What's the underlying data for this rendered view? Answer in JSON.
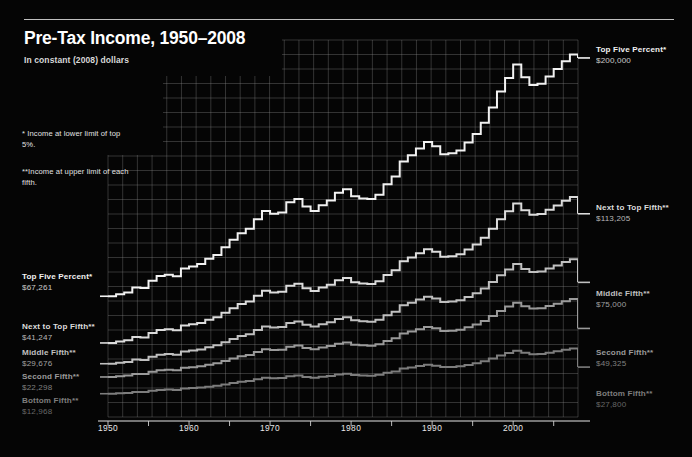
{
  "header": {
    "title": "Pre-Tax Income, 1950–2008",
    "subtitle": "In constant (2008) dollars"
  },
  "footnotes": [
    "* Income at lower limit of top 5%.",
    "**Income at upper limit of each fifth."
  ],
  "labels_left": [
    {
      "name": "Top Five Percent*",
      "value": "$67,261",
      "color": "#f2f2f2",
      "x": 22,
      "y": 272
    },
    {
      "name": "Next to Top Fifth**",
      "value": "$41,247",
      "color": "#dcdcdc",
      "x": 22,
      "y": 322
    },
    {
      "name": "Middle Fifth**",
      "value": "$29,676",
      "color": "#c0c0c0",
      "x": 22,
      "y": 348
    },
    {
      "name": "Second Fifth**",
      "value": "$22,298",
      "color": "#9a9a9a",
      "x": 22,
      "y": 372
    },
    {
      "name": "Bottom Fifth**",
      "value": "$12,968",
      "color": "#7d7d7d",
      "x": 22,
      "y": 396
    }
  ],
  "labels_right": [
    {
      "name": "Top Five Percent*",
      "value": "$200,000",
      "color": "#f2f2f2",
      "x": 596,
      "y": 45
    },
    {
      "name": "Next to Top Fifth**",
      "value": "$113,205",
      "color": "#dcdcdc",
      "x": 596,
      "y": 203
    },
    {
      "name": "Middle Fifth**",
      "value": "$75,000",
      "color": "#c0c0c0",
      "x": 596,
      "y": 289
    },
    {
      "name": "Second Fifth**",
      "value": "$49,325",
      "color": "#9a9a9a",
      "x": 596,
      "y": 348
    },
    {
      "name": "Bottom Fifth**",
      "value": "$27,800",
      "color": "#7d7d7d",
      "x": 596,
      "y": 389
    }
  ],
  "axis": {
    "x_ticks_major": [
      1950,
      1960,
      1970,
      1980,
      1990,
      2000
    ],
    "x_ticks_minor": [
      1955,
      1965,
      1975,
      1985,
      1995,
      2005
    ],
    "x_min": 1950,
    "x_max": 2008
  },
  "chart_data": {
    "type": "line",
    "title": "Pre-Tax Income, 1950–2008",
    "subtitle": "In constant (2008) dollars",
    "xlabel": "",
    "ylabel": "",
    "xlim": [
      1950,
      2008
    ],
    "ylim": [
      0,
      210000
    ],
    "grid": true,
    "legend": "inline-endpoint-labels",
    "notes": [
      "* Income at lower limit of top 5%.",
      "**Income at upper limit of each fifth."
    ],
    "x": [
      1950,
      1951,
      1952,
      1953,
      1954,
      1955,
      1956,
      1957,
      1958,
      1959,
      1960,
      1961,
      1962,
      1963,
      1964,
      1965,
      1966,
      1967,
      1968,
      1969,
      1970,
      1971,
      1972,
      1973,
      1974,
      1975,
      1976,
      1977,
      1978,
      1979,
      1980,
      1981,
      1982,
      1983,
      1984,
      1985,
      1986,
      1987,
      1988,
      1989,
      1990,
      1991,
      1992,
      1993,
      1994,
      1995,
      1996,
      1997,
      1998,
      1999,
      2000,
      2001,
      2002,
      2003,
      2004,
      2005,
      2006,
      2007,
      2008
    ],
    "series": [
      {
        "name": "Top Five Percent*",
        "note": "Income at lower limit of top 5%.",
        "color": "#f2f2f2",
        "start_value": 67261,
        "end_value": 200000,
        "values": [
          67261,
          68400,
          69300,
          72100,
          71800,
          75900,
          78600,
          79200,
          78400,
          82700,
          83900,
          85200,
          88100,
          90300,
          94600,
          98700,
          102400,
          104900,
          110200,
          114800,
          113200,
          113900,
          119600,
          121400,
          117300,
          114800,
          117900,
          120600,
          124900,
          126800,
          122900,
          121700,
          121400,
          123800,
          129600,
          133900,
          142300,
          145800,
          149600,
          153200,
          150800,
          146300,
          146900,
          148400,
          152900,
          157600,
          163900,
          172400,
          181300,
          188900,
          196400,
          189200,
          184900,
          185600,
          189700,
          193800,
          198100,
          201900,
          200000
        ]
      },
      {
        "name": "Next to Top Fifth**",
        "note": "Income at upper limit of each fifth.",
        "color": "#dcdcdc",
        "start_value": 41247,
        "end_value": 113205,
        "values": [
          41247,
          42100,
          42800,
          44600,
          44300,
          46800,
          48400,
          48900,
          48300,
          50900,
          51600,
          52400,
          54200,
          55600,
          58100,
          60600,
          62900,
          64300,
          67500,
          70300,
          69400,
          69800,
          73100,
          74200,
          71700,
          70200,
          72100,
          73700,
          76200,
          77400,
          75100,
          74300,
          74100,
          75600,
          79100,
          81700,
          86800,
          88900,
          91200,
          93400,
          92000,
          89300,
          89600,
          90600,
          93300,
          96100,
          99900,
          104900,
          110100,
          114600,
          118900,
          115100,
          112700,
          113100,
          115400,
          117800,
          120400,
          122600,
          113205
        ]
      },
      {
        "name": "Middle Fifth**",
        "note": "Income at upper limit of each fifth.",
        "color": "#c0c0c0",
        "start_value": 29676,
        "end_value": 75000,
        "values": [
          29676,
          30200,
          30700,
          32000,
          31800,
          33600,
          34700,
          35100,
          34700,
          36500,
          37000,
          37600,
          38900,
          39900,
          41700,
          43500,
          45100,
          46100,
          48400,
          50400,
          49800,
          50100,
          52400,
          53200,
          51400,
          50400,
          51700,
          52800,
          54600,
          55500,
          53900,
          53300,
          53100,
          54200,
          56700,
          58600,
          62200,
          63700,
          65400,
          67000,
          66000,
          64000,
          64300,
          65000,
          66900,
          68900,
          71600,
          75200,
          78900,
          82200,
          85200,
          82500,
          80800,
          81100,
          82700,
          84400,
          86300,
          87900,
          75000
        ]
      },
      {
        "name": "Second Fifth**",
        "note": "Income at upper limit of each fifth.",
        "color": "#9a9a9a",
        "start_value": 22298,
        "end_value": 49325,
        "values": [
          22298,
          22700,
          23100,
          24000,
          23900,
          25200,
          26000,
          26300,
          26000,
          27400,
          27700,
          28200,
          29100,
          29900,
          31200,
          32600,
          33800,
          34500,
          36200,
          37700,
          37300,
          37500,
          39200,
          39800,
          38500,
          37700,
          38700,
          39500,
          40800,
          41500,
          40300,
          39900,
          39700,
          40500,
          42400,
          43800,
          46500,
          47600,
          48900,
          50100,
          49400,
          47900,
          48100,
          48600,
          50000,
          51500,
          53500,
          56200,
          59000,
          61500,
          63700,
          61700,
          60400,
          60600,
          61800,
          63100,
          64500,
          65700,
          49325
        ]
      },
      {
        "name": "Bottom Fifth**",
        "note": "Income at upper limit of each fifth.",
        "color": "#7d7d7d",
        "start_value": 12968,
        "end_value": 27800,
        "values": [
          12968,
          13200,
          13400,
          13900,
          13900,
          14600,
          15100,
          15300,
          15100,
          15900,
          16100,
          16400,
          16900,
          17400,
          18100,
          18900,
          19600,
          20000,
          21000,
          21900,
          21600,
          21700,
          22700,
          23100,
          22300,
          21900,
          22400,
          22900,
          23700,
          24100,
          23400,
          23100,
          23000,
          23500,
          24600,
          25400,
          27000,
          27600,
          28400,
          29100,
          28600,
          27800,
          27900,
          28200,
          29000,
          29900,
          31000,
          32600,
          34200,
          35700,
          36900,
          35800,
          35000,
          35100,
          35800,
          36600,
          37400,
          38100,
          27800
        ]
      }
    ]
  }
}
